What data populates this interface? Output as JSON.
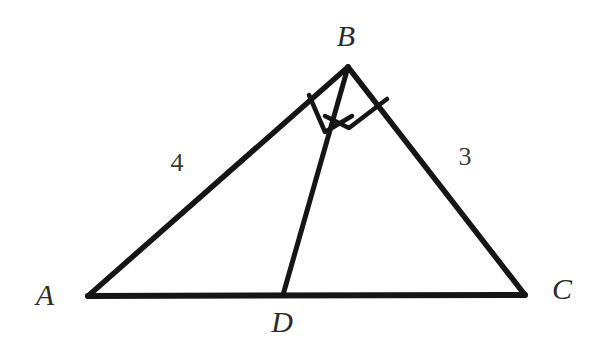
{
  "figure": {
    "type": "geometry-diagram",
    "shape": "triangle-with-altitude-cevian",
    "background_color": "#ffffff",
    "stroke_color": "#151515",
    "stroke_width": 5,
    "base_stroke_width": 6,
    "mark_stroke_width": 4,
    "width": 598,
    "height": 347
  },
  "points": {
    "A": {
      "label": "A",
      "x": 88,
      "y": 296,
      "label_x": 45,
      "label_y": 295
    },
    "B": {
      "label": "B",
      "x": 348,
      "y": 67,
      "label_x": 346,
      "label_y": 36
    },
    "C": {
      "label": "C",
      "x": 525,
      "y": 295,
      "label_x": 562,
      "label_y": 289
    },
    "D": {
      "label": "D",
      "x": 283,
      "y": 295,
      "label_x": 282,
      "label_y": 322
    }
  },
  "segments": [
    {
      "name": "side-AB",
      "from": "A",
      "to": "B",
      "x1": 88,
      "y1": 296,
      "x2": 348,
      "y2": 67
    },
    {
      "name": "side-BC",
      "from": "B",
      "to": "C",
      "x1": 348,
      "y1": 67,
      "x2": 525,
      "y2": 295
    },
    {
      "name": "side-AC",
      "from": "A",
      "to": "C",
      "x1": 88,
      "y1": 296,
      "x2": 525,
      "y2": 295
    },
    {
      "name": "segment-BD",
      "from": "B",
      "to": "D",
      "x1": 348,
      "y1": 67,
      "x2": 283,
      "y2": 295
    }
  ],
  "side_labels": [
    {
      "name": "length-AB",
      "text": "4",
      "x": 177,
      "y": 163,
      "segment": "side-AB"
    },
    {
      "name": "length-BC",
      "text": "3",
      "x": 465,
      "y": 157,
      "segment": "side-BC"
    }
  ],
  "angle_marks": [
    {
      "name": "right-angle-ABD",
      "angle": "ABD",
      "vertex": "B",
      "type": "right-angle-square",
      "path": "M 310 94 L 324 131 L 353 117 L 348 67"
    },
    {
      "name": "right-angle-DBC",
      "angle": "DBC",
      "vertex": "B",
      "type": "right-angle-square",
      "path": "M 387 98 L 349 127 L 324 114"
    }
  ],
  "annotations": {
    "marked_right_angles": [
      "ABD",
      "DBC"
    ],
    "labeled_lengths": {
      "AB": "4",
      "BC": "3"
    }
  }
}
